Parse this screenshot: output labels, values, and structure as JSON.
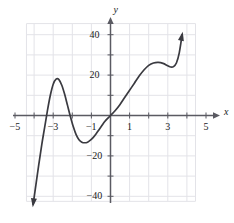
{
  "figure": {
    "background": "#ffffff",
    "grid_color": "#e3e3e8",
    "axis_color": "#5a5a62",
    "curve_color": "#3a3a40"
  },
  "axes": {
    "x_axis_name": "x",
    "y_axis_name": "y",
    "x_ticks": [
      {
        "label": "−5",
        "value": -5
      },
      {
        "label": "−3",
        "value": -3
      },
      {
        "label": "−1",
        "value": -1
      },
      {
        "label": "1",
        "value": 1
      },
      {
        "label": "3",
        "value": 3
      },
      {
        "label": "5",
        "value": 5
      }
    ],
    "y_ticks": [
      {
        "label": "40",
        "value": 40
      },
      {
        "label": "20",
        "value": 20
      },
      {
        "label": "−20",
        "value": -20
      },
      {
        "label": "−40",
        "value": -40
      }
    ]
  },
  "chart_data": {
    "type": "line",
    "title": "",
    "xlabel": "x",
    "ylabel": "y",
    "xlim": [
      -5.4,
      5.4
    ],
    "ylim": [
      -45,
      47
    ],
    "grid": true,
    "legend": null,
    "x_tick_values": [
      -5,
      -4,
      -3,
      -2,
      -1,
      1,
      2,
      3,
      4,
      5
    ],
    "x_tick_labels": [
      "−5",
      "",
      "−3",
      "",
      "−1",
      "1",
      "",
      "3",
      "",
      "5"
    ],
    "y_tick_values": [
      40,
      30,
      20,
      10,
      -10,
      -20,
      -30,
      -40
    ],
    "y_tick_labels": [
      "40",
      "",
      "20",
      "",
      "",
      "−20",
      "",
      "−40"
    ],
    "series": [
      {
        "name": "polynomial-curve",
        "color": "#3a3a40",
        "arrow_start": true,
        "arrow_end": true,
        "x": [
          -4.05,
          -3.9,
          -3.75,
          -3.6,
          -3.45,
          -3.3,
          -3.15,
          -3.0,
          -2.85,
          -2.7,
          -2.55,
          -2.4,
          -2.25,
          -2.1,
          -1.95,
          -1.8,
          -1.65,
          -1.5,
          -1.35,
          -1.2,
          -1.05,
          -0.9,
          -0.75,
          -0.6,
          -0.45,
          -0.3,
          -0.15,
          0.0,
          0.25,
          0.5,
          0.75,
          1.0,
          1.25,
          1.5,
          1.75,
          2.0,
          2.25,
          2.5,
          2.75,
          3.0,
          3.15,
          3.3,
          3.45,
          3.6,
          3.75
        ],
        "y": [
          -44.0,
          -34.0,
          -24.0,
          -14.5,
          -6.0,
          2.5,
          10.0,
          15.5,
          18.0,
          17.8,
          15.0,
          10.5,
          5.0,
          -0.5,
          -5.5,
          -9.5,
          -12.0,
          -13.2,
          -13.5,
          -13.2,
          -12.2,
          -10.8,
          -9.0,
          -7.0,
          -5.0,
          -3.0,
          -1.4,
          0.0,
          2.5,
          5.5,
          9.0,
          12.5,
          16.0,
          19.5,
          22.5,
          24.8,
          26.0,
          26.3,
          25.8,
          24.6,
          24.0,
          24.2,
          26.0,
          31.0,
          40.0
        ]
      }
    ],
    "annotations": {
      "local_max_left": {
        "x": -2.8,
        "y": 18
      },
      "local_min_center": {
        "x": -1.3,
        "y": -13.5
      },
      "local_max_right": {
        "x": 2.45,
        "y": 26.3
      },
      "local_min_right": {
        "x": 3.15,
        "y": 24.0
      },
      "zeros": [
        -3.4,
        -2.1,
        0.0
      ]
    }
  }
}
